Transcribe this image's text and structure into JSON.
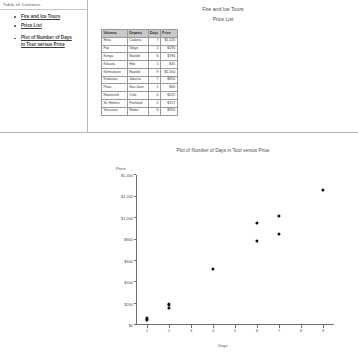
{
  "toc": {
    "title": "Table of Contents",
    "items": [
      {
        "label": "Fire and Ice Tours"
      },
      {
        "label": "Price List"
      },
      {
        "label": "Plot of Number of Days in Tour versus Price"
      }
    ]
  },
  "document": {
    "title": "Fire and Ice Tours",
    "subtitle": "Price List"
  },
  "table": {
    "columns": [
      "Volcano",
      "Departs",
      "Days",
      "Price"
    ],
    "rows": [
      {
        "volcano": "Etna",
        "departs": "Catania",
        "days": "7",
        "price": "$1,020"
      },
      {
        "volcano": "Fuji",
        "departs": "Tokyo",
        "days": "2",
        "price": "$190"
      },
      {
        "volcano": "Kenya",
        "departs": "Nairobi",
        "days": "6",
        "price": "$780"
      },
      {
        "volcano": "Kilauea",
        "departs": "Hilo",
        "days": "1",
        "price": "$45"
      },
      {
        "volcano": "Kilimanjaro",
        "departs": "Nairobi",
        "days": "9",
        "price": "$1,260"
      },
      {
        "volcano": "Krakatau",
        "departs": "Jakarta",
        "days": "7",
        "price": "$850"
      },
      {
        "volcano": "Poas",
        "departs": "San Jose",
        "days": "1",
        "price": "$60"
      },
      {
        "volcano": "Roosevelt",
        "departs": "Oslo",
        "days": "4",
        "price": "$525"
      },
      {
        "volcano": "St. Helens",
        "departs": "Portland",
        "days": "2",
        "price": "$157"
      },
      {
        "volcano": "Vesuvius",
        "departs": "Rome",
        "days": "6",
        "price": "$950"
      }
    ]
  },
  "chart_data": {
    "type": "scatter",
    "title": "Plot of Number of Days in Tour versus Price",
    "xlabel": "Days",
    "ylabel": "Price",
    "xlim": [
      0.5,
      9.5
    ],
    "ylim": [
      0,
      1400
    ],
    "grid": false,
    "legend": false,
    "xticks": [
      "1",
      "2",
      "3",
      "4",
      "5",
      "6",
      "7",
      "8",
      "9"
    ],
    "xtickvals": [
      1,
      2,
      3,
      4,
      5,
      6,
      7,
      8,
      9
    ],
    "yticks": [
      "$0",
      "$200",
      "$400",
      "$600",
      "$800",
      "$1,000",
      "$1,200",
      "$1,400"
    ],
    "ytickvals": [
      0,
      200,
      400,
      600,
      800,
      1000,
      1200,
      1400
    ],
    "points": [
      {
        "x": 1,
        "y": 45
      },
      {
        "x": 1,
        "y": 60
      },
      {
        "x": 2,
        "y": 190
      },
      {
        "x": 2,
        "y": 157
      },
      {
        "x": 4,
        "y": 525
      },
      {
        "x": 6,
        "y": 950
      },
      {
        "x": 6,
        "y": 780
      },
      {
        "x": 7,
        "y": 1020
      },
      {
        "x": 7,
        "y": 850
      },
      {
        "x": 9,
        "y": 1260
      }
    ]
  }
}
